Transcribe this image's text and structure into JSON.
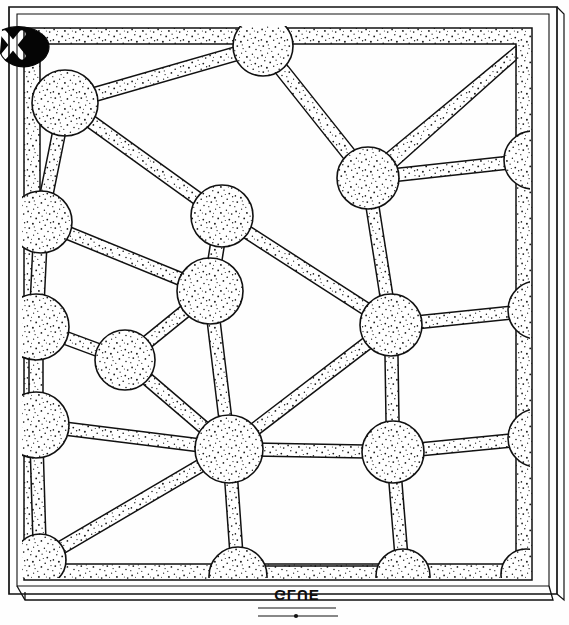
{
  "figure": {
    "style": "patent-style pen-and-ink line art with stipple shading",
    "medium_label": "GLUE",
    "medium_label_transform": "mirrored and rotated handwritten annotation",
    "corner_mark": "X",
    "corner_mark_description": "solid black ink blob bearing a reserved white X at the upper-left",
    "background_color": "#fefefe",
    "ink_color": "#111111",
    "stipple_color": "#1a1a1a",
    "fill_color": "#ffffff"
  },
  "frame": {
    "outer": {
      "x": 8,
      "y": 6,
      "width": 552,
      "height": 592,
      "stroke_width": 1.6
    },
    "outer_shadow": {
      "x": 12,
      "y": 10,
      "width": 552,
      "height": 586,
      "stroke_width": 1.2
    },
    "inner_band": {
      "x": 22,
      "y": 26,
      "width": 508,
      "height": 552,
      "band_thickness": 16
    },
    "baseplate": {
      "x": 14,
      "y": 578,
      "width": 546,
      "height": 22
    }
  },
  "lattice": {
    "node_count": 26,
    "strut_count": 40,
    "default_node_radius": 30,
    "default_strut_width": 13,
    "nodes": [
      {
        "id": "n1",
        "label": "node-upper-left",
        "cx": 65,
        "cy": 103,
        "r": 33
      },
      {
        "id": "n2",
        "label": "node-top-center",
        "cx": 263,
        "cy": 46,
        "r": 30
      },
      {
        "id": "n3",
        "label": "node-top-right-inner",
        "cx": 368,
        "cy": 178,
        "r": 31
      },
      {
        "id": "n4",
        "label": "node-right-edge-upper",
        "cx": 533,
        "cy": 160,
        "r": 29
      },
      {
        "id": "n5",
        "label": "node-left-edge-upper",
        "cx": 41,
        "cy": 222,
        "r": 31
      },
      {
        "id": "n6",
        "label": "node-mid-upper",
        "cx": 222,
        "cy": 216,
        "r": 31
      },
      {
        "id": "n7",
        "label": "node-mid-center",
        "cx": 210,
        "cy": 291,
        "r": 33
      },
      {
        "id": "n8",
        "label": "node-left-edge-mid",
        "cx": 36,
        "cy": 327,
        "r": 33
      },
      {
        "id": "n9",
        "label": "node-inner-left",
        "cx": 125,
        "cy": 360,
        "r": 30
      },
      {
        "id": "n10",
        "label": "node-right-center",
        "cx": 391,
        "cy": 325,
        "r": 31
      },
      {
        "id": "n11",
        "label": "node-right-edge-mid",
        "cx": 537,
        "cy": 310,
        "r": 29
      },
      {
        "id": "n12",
        "label": "node-left-edge-lower",
        "cx": 36,
        "cy": 425,
        "r": 33
      },
      {
        "id": "n13",
        "label": "node-hub-center",
        "cx": 229,
        "cy": 449,
        "r": 34
      },
      {
        "id": "n14",
        "label": "node-lower-right",
        "cx": 393,
        "cy": 452,
        "r": 31
      },
      {
        "id": "n15",
        "label": "node-right-edge-lower",
        "cx": 537,
        "cy": 438,
        "r": 29
      },
      {
        "id": "n16",
        "label": "node-bottom-center",
        "cx": 238,
        "cy": 576,
        "r": 29
      },
      {
        "id": "n17",
        "label": "node-bottom-right",
        "cx": 403,
        "cy": 576,
        "r": 27
      },
      {
        "id": "n18",
        "label": "node-bottom-far-right",
        "cx": 526,
        "cy": 574,
        "r": 25
      },
      {
        "id": "n19",
        "label": "node-bottom-left",
        "cx": 40,
        "cy": 560,
        "r": 26
      }
    ],
    "struts": [
      {
        "from": "n1",
        "to": "n2",
        "w": 14
      },
      {
        "from": "n1",
        "to": "n5",
        "w": 13
      },
      {
        "from": "n1",
        "to": "n6",
        "w": 13
      },
      {
        "from": "n2",
        "to": "n3",
        "w": 14
      },
      {
        "from": "n3",
        "to": "n4",
        "w": 13
      },
      {
        "from": "n3",
        "to": "n10",
        "w": 13
      },
      {
        "from": "n5",
        "to": "n7",
        "w": 13
      },
      {
        "from": "n5",
        "to": "n8",
        "w": 14
      },
      {
        "from": "n6",
        "to": "n7",
        "w": 14
      },
      {
        "from": "n6",
        "to": "n10",
        "w": 13
      },
      {
        "from": "n7",
        "to": "n9",
        "w": 13
      },
      {
        "from": "n7",
        "to": "n13",
        "w": 13
      },
      {
        "from": "n8",
        "to": "n9",
        "w": 13
      },
      {
        "from": "n8",
        "to": "n12",
        "w": 14
      },
      {
        "from": "n9",
        "to": "n13",
        "w": 13
      },
      {
        "from": "n10",
        "to": "n11",
        "w": 13
      },
      {
        "from": "n10",
        "to": "n13",
        "w": 13
      },
      {
        "from": "n10",
        "to": "n14",
        "w": 13
      },
      {
        "from": "n12",
        "to": "n13",
        "w": 13
      },
      {
        "from": "n12",
        "to": "n19",
        "w": 13
      },
      {
        "from": "n13",
        "to": "n14",
        "w": 13
      },
      {
        "from": "n13",
        "to": "n16",
        "w": 13
      },
      {
        "from": "n13",
        "to": "n19",
        "w": 13
      },
      {
        "from": "n14",
        "to": "n15",
        "w": 13
      },
      {
        "from": "n14",
        "to": "n17",
        "w": 13
      },
      {
        "from": "n16",
        "to": "n17",
        "w": 12
      }
    ],
    "cells": [
      {
        "label": "cell-top-left-triangle"
      },
      {
        "label": "cell-top-wide-quad"
      },
      {
        "label": "cell-upper-right-wedge"
      },
      {
        "label": "cell-left-strip"
      },
      {
        "label": "cell-center-quad"
      },
      {
        "label": "cell-lower-left-triangle"
      },
      {
        "label": "cell-lower-right-quad"
      },
      {
        "label": "cell-bottom-strip"
      }
    ]
  },
  "colors": {
    "paper": "#fefefe",
    "ink": "#111111",
    "stipple": "#1a1a1a",
    "blob": "#050505",
    "reserve_white": "#ffffff"
  }
}
